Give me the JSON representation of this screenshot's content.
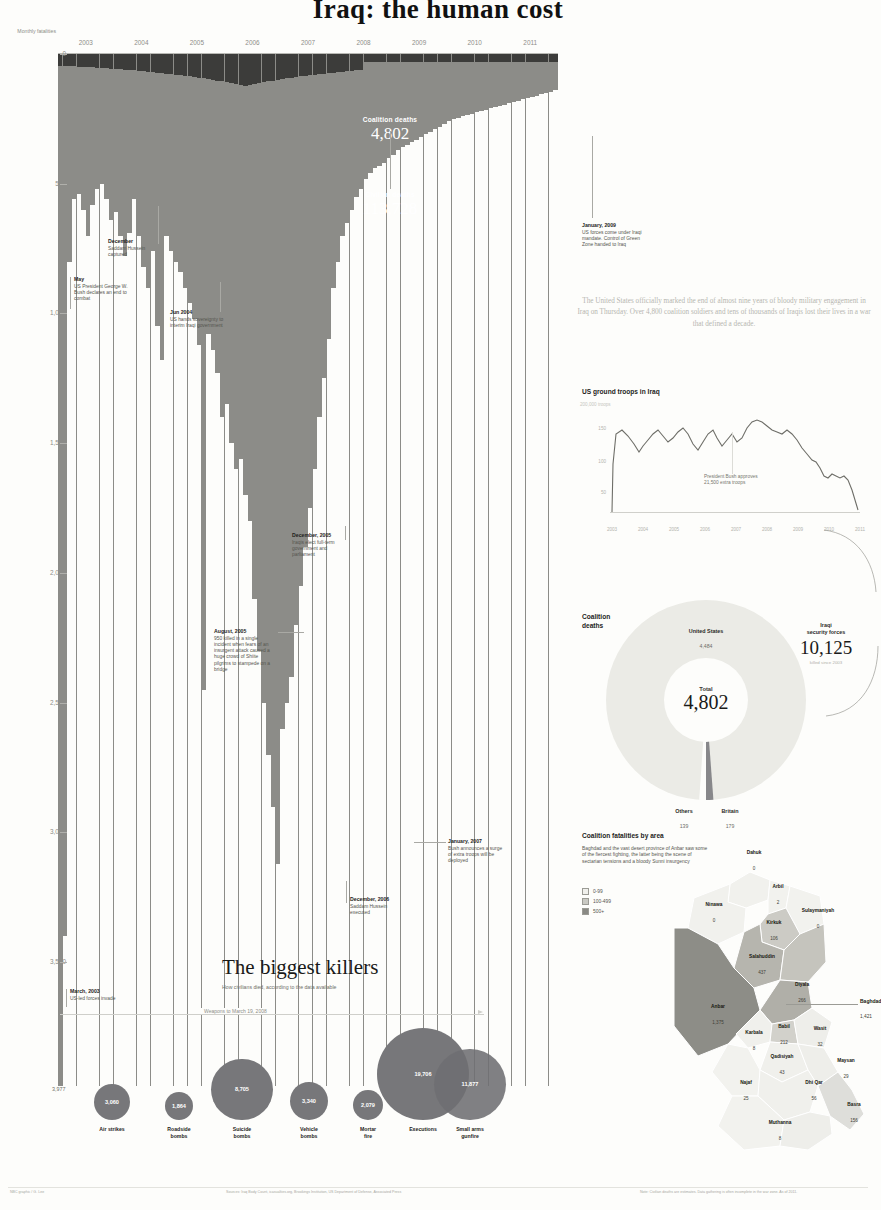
{
  "masthead": {
    "title": "Iraq: the human cost"
  },
  "timeline": {
    "y_axis_label": "Monthly fatalities",
    "y_ticks": [
      "0",
      "500",
      "1,000",
      "1,500",
      "2,000",
      "2,500",
      "3,000",
      "3,500"
    ],
    "y_max_label": "3,977",
    "years": [
      "2003",
      "2004",
      "2005",
      "2006",
      "2007",
      "2008",
      "2009",
      "2010",
      "2011"
    ],
    "coalition": {
      "label": "Coalition deaths",
      "value": "4,802"
    },
    "civilian": {
      "label": "Civilian deaths",
      "value": "113,728"
    },
    "notes": [
      {
        "head": "May",
        "body": "US President George W. Bush declares an end to combat"
      },
      {
        "head": "December",
        "body": "Saddam Hussein captured"
      },
      {
        "head": "Jun 2004",
        "body": "US hands sovereignty to interim Iraqi government"
      },
      {
        "head": "December, 2005",
        "body": "Iraqis elect full-term government and parliament"
      },
      {
        "head": "August, 2005",
        "body": "950 killed in a single incident when fears of an insurgent attack caused a huge crowd of Shiite pilgrims to stampede on a bridge"
      },
      {
        "head": "December, 2006",
        "body": "Saddam Hussein executed"
      },
      {
        "head": "January, 2007",
        "body": "Bush announces a surge of extra troops will be deployed"
      },
      {
        "head": "January, 2009",
        "body": "US forces come under Iraqi mandate. Control of Green Zone handed to Iraq"
      },
      {
        "head": "March, 2003",
        "body": "US-led forces invade"
      }
    ]
  },
  "chart_data": [
    {
      "type": "bar",
      "title": "Iraq war monthly fatalities",
      "xlabel": "",
      "ylabel": "Monthly fatalities",
      "ylim": [
        0,
        3977
      ],
      "series": [
        {
          "name": "Civilian deaths",
          "total": 113728
        },
        {
          "name": "Coalition deaths",
          "total": 4802
        }
      ],
      "categories": [
        "2003",
        "2004",
        "2005",
        "2006",
        "2007",
        "2008",
        "2009",
        "2010",
        "2011"
      ],
      "monthly_civilian": [
        3977,
        3400,
        800,
        560,
        540,
        600,
        700,
        580,
        520,
        500,
        560,
        640,
        610,
        700,
        780,
        690,
        560,
        700,
        820,
        900,
        760,
        1050,
        1180,
        700,
        760,
        800,
        840,
        900,
        960,
        1020,
        1120,
        2450,
        1080,
        1140,
        1230,
        1400,
        1350,
        1500,
        1600,
        1560,
        1700,
        1800,
        2100,
        2300,
        2500,
        2700,
        2900,
        3120,
        2600,
        2500,
        2400,
        2200,
        2050,
        1900,
        1750,
        1600,
        1400,
        1250,
        1100,
        900,
        800,
        700,
        650,
        600,
        550,
        520,
        480,
        460,
        440,
        430,
        420,
        400,
        390,
        370,
        360,
        350,
        340,
        330,
        320,
        310,
        300,
        290,
        280,
        270,
        260,
        250,
        245,
        240,
        235,
        230,
        225,
        220,
        215,
        210,
        205,
        200,
        195,
        190,
        185,
        180,
        175,
        170,
        165,
        160,
        155,
        150,
        145,
        140
      ]
    },
    {
      "type": "line",
      "title": "US ground troops in Iraq",
      "ylabel": "Troops",
      "y_ticks": [
        "200,000",
        "150",
        "100",
        "50",
        "0"
      ],
      "x_ticks": [
        "2003",
        "2004",
        "2005",
        "2006",
        "2007",
        "2008",
        "2009",
        "2010",
        "2011"
      ],
      "annotation": "President Bush approves 21,500 extra troops",
      "values": [
        0,
        150,
        160,
        155,
        140,
        135,
        150,
        158,
        145,
        150,
        160,
        155,
        145,
        158,
        165,
        175,
        170,
        160,
        150,
        140,
        120,
        100,
        90,
        85,
        70,
        65,
        64,
        50,
        30,
        10,
        0
      ]
    },
    {
      "type": "pie",
      "title": "Coalition deaths",
      "center_label": "Total",
      "center_value": "4,802",
      "labels": [
        "United States",
        "Britain",
        "Others"
      ],
      "values": [
        4484,
        179,
        139
      ]
    },
    {
      "type": "table",
      "title": "The biggest killers",
      "subtitle": "How civilians died, according to the data available",
      "note": "Weapons to March 19, 2008",
      "categories": [
        "Air strikes",
        "Roadside bombs",
        "Suicide bombs",
        "Vehicle bombs",
        "Mortar fire",
        "Executions",
        "Small arms gunfire"
      ],
      "values": [
        3060,
        1864,
        8705,
        3340,
        2079,
        19706,
        11877
      ]
    },
    {
      "type": "heatmap",
      "title": "Coalition fatalities by area",
      "legend": [
        "0-99",
        "100-499",
        "500+"
      ],
      "categories": [
        "Dahuk",
        "Ninawa",
        "Arbil",
        "Sulaymaniyah",
        "Kirkuk",
        "Salahuddin",
        "Diyala",
        "Anbar",
        "Baghdad",
        "Karbala",
        "Babil",
        "Wasit",
        "Qadisiyah",
        "Maysan",
        "Najaf",
        "Dhi Qar",
        "Basra",
        "Muthanna"
      ],
      "values": [
        0,
        0,
        2,
        0,
        106,
        437,
        266,
        1375,
        1421,
        8,
        212,
        32,
        43,
        29,
        25,
        56,
        156,
        8
      ]
    }
  ],
  "intro": {
    "paragraph": "The United States officially marked the end of almost nine years of bloody military engagement in Iraq on Thursday. Over 4,800 coalition soldiers and tens of thousands of Iraqis lost their lives in a war that defined a decade."
  },
  "troops_chart": {
    "title": "US ground troops in Iraq",
    "y_top_label": "200,000 troops",
    "y_ticks": [
      "150",
      "100",
      "50"
    ],
    "x_ticks": [
      "2003",
      "2004",
      "2005",
      "2006",
      "2007",
      "2008",
      "2009",
      "2010",
      "2011"
    ],
    "note": "President Bush approves 21,500 extra troops"
  },
  "donut": {
    "title_line1": "Coalition",
    "title_line2": "deaths",
    "center_label": "Total",
    "center_value": "4,802",
    "us_label": "United States",
    "us_value": "4,484",
    "others_label": "Others",
    "others_value": "139",
    "britain_label": "Britain",
    "britain_value": "179",
    "isf_label_1": "Iraqi",
    "isf_label_2": "security forces",
    "isf_value": "10,125",
    "isf_sub": "killed since 2003"
  },
  "map": {
    "title": "Coalition fatalities by area",
    "intro": "Baghdad and the vast desert province of Anbar saw some of the fiercest fighting, the latter being the scene of sectarian tensions and a bloody Sunni insurgency",
    "legend": [
      "0-99",
      "100-499",
      "500+"
    ],
    "baghdad_label": "Baghdad",
    "baghdad_value": "1,421",
    "provinces": [
      {
        "name": "Dahuk",
        "value": "0"
      },
      {
        "name": "Ninawa",
        "value": "0"
      },
      {
        "name": "Arbil",
        "value": "2"
      },
      {
        "name": "Sulaymaniyah",
        "value": "0"
      },
      {
        "name": "Kirkuk",
        "value": "106"
      },
      {
        "name": "Salahuddin",
        "value": "437"
      },
      {
        "name": "Diyala",
        "value": "266"
      },
      {
        "name": "Anbar",
        "value": "1,375"
      },
      {
        "name": "Karbala",
        "value": "8"
      },
      {
        "name": "Babil",
        "value": "212"
      },
      {
        "name": "Wasit",
        "value": "32"
      },
      {
        "name": "Qadisiyah",
        "value": "43"
      },
      {
        "name": "Maysan",
        "value": "29"
      },
      {
        "name": "Najaf",
        "value": "25"
      },
      {
        "name": "Dhi Qar",
        "value": "56"
      },
      {
        "name": "Basra",
        "value": "156"
      },
      {
        "name": "Muthanna",
        "value": "8"
      }
    ]
  },
  "killers": {
    "title": "The biggest killers",
    "subtitle": "How civilians died, according to the data available",
    "rule_label": "Weapons to March 19, 2008",
    "items": [
      {
        "label_1": "Air strikes",
        "label_2": "",
        "value": "3,060"
      },
      {
        "label_1": "Roadside",
        "label_2": "bombs",
        "value": "1,864"
      },
      {
        "label_1": "Suicide",
        "label_2": "bombs",
        "value": "8,705"
      },
      {
        "label_1": "Vehicle",
        "label_2": "bombs",
        "value": "3,340"
      },
      {
        "label_1": "Mortar",
        "label_2": "fire",
        "value": "2,079"
      },
      {
        "label_1": "Executions",
        "label_2": "",
        "value": "19,706"
      },
      {
        "label_1": "Small arms",
        "label_2": "gunfire",
        "value": "11,877"
      }
    ]
  },
  "footer": {
    "left": "NBC graphic / G. Lee",
    "center": "Sources: Iraq Body Count, icasualties.org, Brookings Institution, US Department of Defense, Associated Press",
    "right": "Note: Civilian deaths are estimates. Data gathering is often incomplete in the war zone. As of 2011."
  }
}
